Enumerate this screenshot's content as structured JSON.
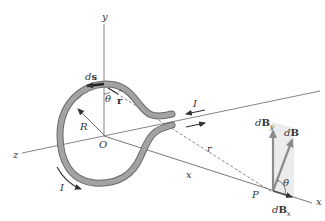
{
  "figure": {
    "type": "physics-diagram",
    "colors": {
      "wire": "#9a9a9a",
      "wire_edge": "#6a6a6a",
      "axis": "#555555",
      "arrow": "#333333",
      "vector": "#8c8c8c",
      "shade": "#ececec"
    }
  },
  "labels": {
    "y_axis": "y",
    "z_axis": "z",
    "x_axis_end": "x",
    "x_distance": "x",
    "origin": "O",
    "radius": "R",
    "ds": "ds",
    "ds_d": "d",
    "ds_s": "s",
    "theta_top": "θ",
    "r_hat": "r̂",
    "r_hat_r": "r",
    "current_top": "I",
    "current_bottom": "I",
    "distance_r": "r",
    "point": "P",
    "dB": "dB",
    "dB_d": "d",
    "dB_B": "B",
    "dBy_d": "d",
    "dBy_B": "B",
    "dBy_sub": "y",
    "dBx_d": "d",
    "dBx_B": "B",
    "dBx_sub": "x",
    "theta_P": "θ"
  }
}
